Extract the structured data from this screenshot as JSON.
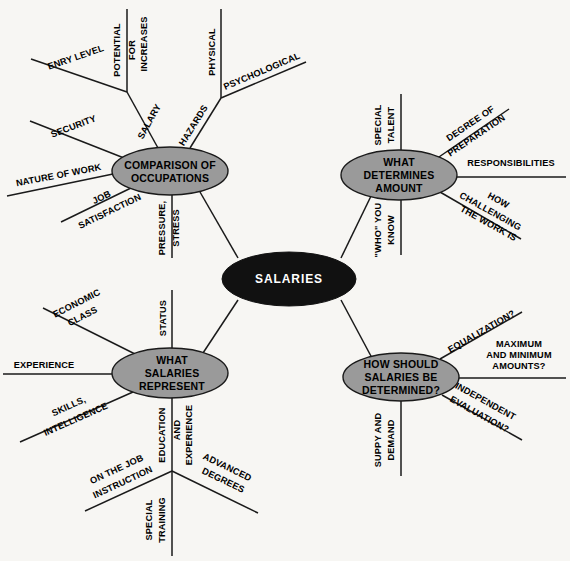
{
  "diagram": {
    "title": "SALARIES",
    "type": "mind-map",
    "background_color": "#f7f6f3",
    "node_fill": "#9a9a9a",
    "root_fill": "#111111",
    "line_color": "#1a1a1a"
  },
  "root": {
    "label": "SALARIES",
    "cx": 289,
    "cy": 279,
    "rx": 67,
    "ry": 27
  },
  "branches": [
    {
      "id": "comparison-of-occupations",
      "label_lines": [
        "COMPARISON OF",
        "OCCUPATIONS"
      ],
      "cx": 170,
      "cy": 171,
      "rx": 58,
      "ry": 24,
      "sub": [
        {
          "id": "entry-level",
          "label_lines": [
            "ENRY LEVEL"
          ]
        },
        {
          "id": "potential-for-increases",
          "label_lines": [
            "POTENTIAL",
            "FOR",
            "INCREASES"
          ]
        },
        {
          "id": "salary",
          "label_lines": [
            "SALARY"
          ]
        },
        {
          "id": "hazards",
          "label_lines": [
            "HAZARDS"
          ]
        },
        {
          "id": "physical",
          "label_lines": [
            "PHYSICAL"
          ]
        },
        {
          "id": "psychological",
          "label_lines": [
            "PSYCHOLOGICAL"
          ]
        },
        {
          "id": "security",
          "label_lines": [
            "SECURITY"
          ]
        },
        {
          "id": "nature-of-work",
          "label_lines": [
            "NATURE OF WORK"
          ]
        },
        {
          "id": "job-satisfaction",
          "label_lines": [
            "JOB",
            "SATISFACTION"
          ]
        },
        {
          "id": "pressure-stress",
          "label_lines": [
            "PRESSURE,",
            "STRESS"
          ]
        }
      ]
    },
    {
      "id": "what-determines-amount",
      "label_lines": [
        "WHAT",
        "DETERMINES",
        "AMOUNT"
      ],
      "cx": 399,
      "cy": 175,
      "rx": 58,
      "ry": 25,
      "sub": [
        {
          "id": "special-talent",
          "label_lines": [
            "SPECIAL",
            "TALENT"
          ]
        },
        {
          "id": "degree-of-preparation",
          "label_lines": [
            "DEGREE OF",
            "PREPARATION"
          ]
        },
        {
          "id": "responsibilities",
          "label_lines": [
            "RESPONSIBILITIES"
          ]
        },
        {
          "id": "how-challenging-the-work-is",
          "label_lines": [
            "HOW",
            "CHALLENGING",
            "THE WORK IS"
          ]
        },
        {
          "id": "who-you-know",
          "label_lines": [
            "\"WHO\" YOU",
            "KNOW"
          ]
        }
      ]
    },
    {
      "id": "what-salaries-represent",
      "label_lines": [
        "WHAT",
        "SALARIES",
        "REPRESENT"
      ],
      "cx": 170,
      "cy": 373,
      "rx": 58,
      "ry": 25,
      "sub": [
        {
          "id": "status",
          "label_lines": [
            "STATUS"
          ]
        },
        {
          "id": "economic-class",
          "label_lines": [
            "ECONOMIC",
            "CLASS"
          ]
        },
        {
          "id": "experience",
          "label_lines": [
            "EXPERIENCE"
          ]
        },
        {
          "id": "skills-intelligence",
          "label_lines": [
            "SKILLS,",
            "INTELLIGENCE"
          ]
        },
        {
          "id": "education-and-experience",
          "label_lines": [
            "EDUCATION",
            "AND",
            "EXPERIENCE"
          ]
        },
        {
          "id": "on-the-job-instruction",
          "label_lines": [
            "ON THE JOB",
            "INSTRUCTION"
          ]
        },
        {
          "id": "special-training",
          "label_lines": [
            "SPECIAL",
            "TRAINING"
          ]
        },
        {
          "id": "advanced-degrees",
          "label_lines": [
            "ADVANCED",
            "DEGREES"
          ]
        }
      ]
    },
    {
      "id": "how-should-salaries-be-determined",
      "label_lines": [
        "HOW SHOULD",
        "SALARIES BE",
        "DETERMINED?"
      ],
      "cx": 401,
      "cy": 377,
      "rx": 58,
      "ry": 24,
      "sub": [
        {
          "id": "equalization",
          "label_lines": [
            "EQUALIZATION?"
          ]
        },
        {
          "id": "maximum-and-minimum-amounts",
          "label_lines": [
            "MAXIMUM",
            "AND MINIMUM",
            "AMOUNTS?"
          ]
        },
        {
          "id": "independent-evaluation",
          "label_lines": [
            "INDEPENDENT",
            "EVALUATION?"
          ]
        },
        {
          "id": "supply-and-demand",
          "label_lines": [
            "SUPPY AND",
            "DEMAND"
          ]
        }
      ]
    }
  ]
}
